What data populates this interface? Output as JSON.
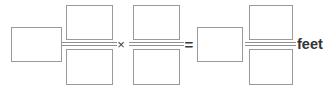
{
  "problem": {
    "type": "fill-in-the-blank-equation",
    "expression": "[ ] × [ ]/[ ] × [ ]/[ ] = [ ] × [ ]/[ ] feet",
    "unit_label": "feet",
    "operators": {
      "multiply": "×",
      "equals": "="
    },
    "colors": {
      "box_border": "#9a9a9a",
      "fraction_bar": "#8f8f8f",
      "operator_text": "#3a3a3a",
      "unit_text": "#333333",
      "background": "#ffffff"
    },
    "terms": [
      {
        "id": "term-1",
        "kind": "box",
        "value": "",
        "placeholder": ""
      },
      {
        "id": "term-2",
        "kind": "fraction",
        "numerator": {
          "value": "",
          "placeholder": ""
        },
        "denominator": {
          "value": "",
          "placeholder": ""
        }
      },
      {
        "id": "term-3",
        "kind": "fraction",
        "numerator": {
          "value": "",
          "placeholder": ""
        },
        "denominator": {
          "value": "",
          "placeholder": ""
        }
      },
      {
        "id": "term-4",
        "kind": "box",
        "value": "",
        "placeholder": ""
      },
      {
        "id": "term-5",
        "kind": "fraction",
        "numerator": {
          "value": "",
          "placeholder": ""
        },
        "denominator": {
          "value": "",
          "placeholder": ""
        }
      }
    ]
  }
}
